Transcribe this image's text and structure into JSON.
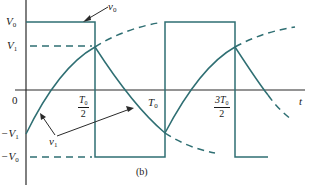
{
  "figure": {
    "caption": "(b)",
    "colors": {
      "signal": "#2f6f73",
      "axis": "#2a2a2a",
      "text": "#1a1a1a"
    }
  },
  "axes": {
    "x_label": "t",
    "y_ticks": [
      {
        "label": "V",
        "sub": "0",
        "prefix": ""
      },
      {
        "label": "V",
        "sub": "1",
        "prefix": ""
      },
      {
        "label": "0",
        "sub": "",
        "prefix": ""
      },
      {
        "label": "V",
        "sub": "1",
        "prefix": "−"
      },
      {
        "label": "V",
        "sub": "0",
        "prefix": "−"
      }
    ],
    "x_ticks": [
      {
        "num": "T",
        "sub": "0",
        "den": "2"
      },
      {
        "label": "T",
        "sub": "0"
      },
      {
        "num": "3T",
        "sub": "0",
        "den": "2"
      }
    ]
  },
  "annotations": {
    "v0": {
      "label": "v",
      "sub": "0"
    },
    "v1": {
      "label": "v",
      "sub": "1"
    }
  }
}
